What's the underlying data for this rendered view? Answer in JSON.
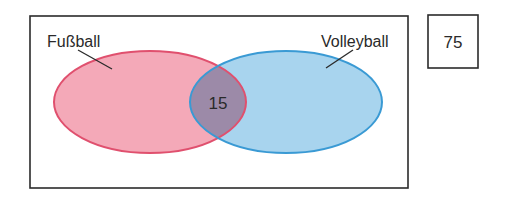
{
  "diagram": {
    "type": "venn",
    "universe_box": {
      "x": 30,
      "y": 16,
      "width": 378,
      "height": 172
    },
    "outside_count": {
      "value": "75",
      "box": {
        "x": 428,
        "y": 15,
        "width": 50,
        "height": 53
      }
    },
    "sets": [
      {
        "name": "Fußball",
        "label": "Fußball",
        "fill": "#f4a9b8",
        "stroke": "#e0506e",
        "cx": 150,
        "cy": 102,
        "rx": 96,
        "ry": 51,
        "label_x": 47,
        "label_y": 47,
        "leader": [
          78,
          50,
          112,
          69
        ]
      },
      {
        "name": "Volleyball",
        "label": "Volleyball",
        "fill": "#a8d4ee",
        "stroke": "#3a9ad4",
        "cx": 286,
        "cy": 102,
        "rx": 96,
        "ry": 51,
        "label_x": 321,
        "label_y": 47,
        "leader": [
          353,
          50,
          326,
          68
        ]
      }
    ],
    "intersection": {
      "value": "15",
      "fill": "#9c8aa8",
      "x": 218,
      "y": 103
    }
  }
}
